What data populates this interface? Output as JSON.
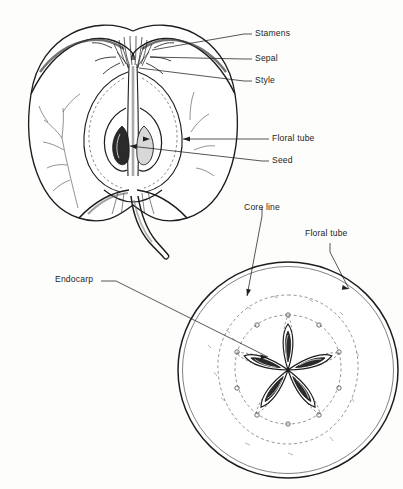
{
  "figure": {
    "background_color": "#fdfdfb",
    "ink_color": "#1d1d1d",
    "label_font_size_px": 8.6
  },
  "labels": {
    "stamens": {
      "text": "Stamens",
      "x": 255,
      "y": 33,
      "points_to": "calyx-stamen-cluster"
    },
    "sepal": {
      "text": "Sepal",
      "x": 255,
      "y": 58,
      "points_to": "calyx-sepal"
    },
    "style": {
      "text": "Style",
      "x": 255,
      "y": 80,
      "points_to": "style-column"
    },
    "floral_tube_1": {
      "text": "Floral tube",
      "x": 272,
      "y": 138,
      "points_to": "floral-tube-wall-longitudinal"
    },
    "seed": {
      "text": "Seed",
      "x": 272,
      "y": 160,
      "points_to": "seed-in-locule"
    },
    "core_line": {
      "text": "Core line",
      "x": 244,
      "y": 209,
      "points_to": "core-line-dashed-circle"
    },
    "floral_tube_2": {
      "text": "Floral tube",
      "x": 305,
      "y": 234,
      "points_to": "floral-tube-transverse"
    },
    "endocarp": {
      "text": "Endocarp",
      "x": 55,
      "y": 279,
      "points_to": "endocarp-carpel-wall"
    }
  },
  "views": {
    "longitudinal": {
      "name": "Longitudinal section of apple",
      "center_x": 133,
      "center_y": 130,
      "parts": [
        "skin",
        "flesh",
        "floral tube",
        "core line",
        "locules",
        "seeds",
        "stamens",
        "sepals",
        "style",
        "stem",
        "vascular bundles"
      ]
    },
    "transverse": {
      "name": "Transverse section of apple",
      "center_x": 288,
      "center_y": 370,
      "radius": 110,
      "carpel_count": 5,
      "seed_count": 5,
      "parts": [
        "skin",
        "flesh",
        "core line",
        "floral tube line",
        "endocarp",
        "carpels",
        "seeds",
        "vascular bundle dots"
      ]
    }
  }
}
